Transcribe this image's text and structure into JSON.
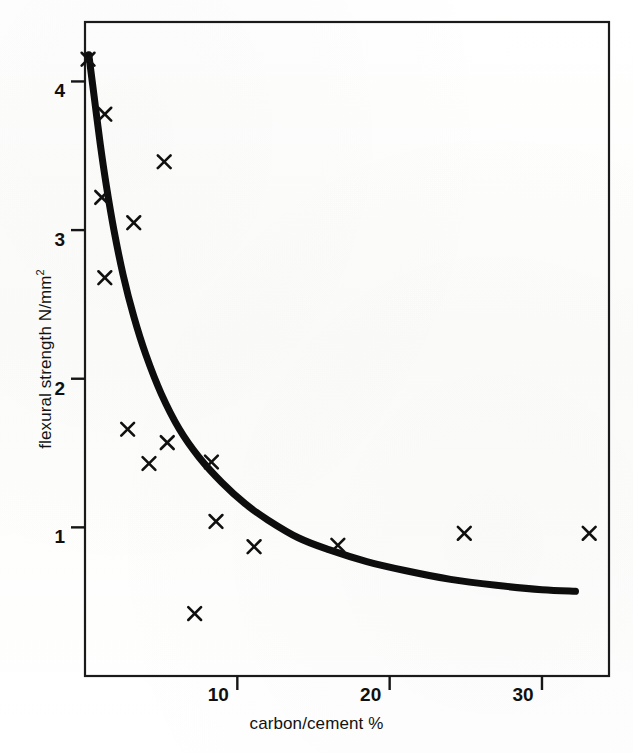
{
  "figure": {
    "background_color": "#fdfdfb",
    "ink_color": "#101010"
  },
  "chart_data": {
    "type": "scatter",
    "title": "",
    "subtitle": "",
    "xlabel": "carbon/cement %",
    "ylabel": "flexural strength N/mm²",
    "ylabel_plain": "flexural strength N/mm2",
    "xlim": [
      0,
      34.4
    ],
    "ylim": [
      0,
      4.4
    ],
    "xticks": [
      10,
      20,
      30
    ],
    "xtick_labels": [
      "10",
      "20",
      "30"
    ],
    "yticks": [
      1,
      2,
      3,
      4
    ],
    "ytick_labels": [
      "1",
      "2",
      "3",
      "4"
    ],
    "grid": false,
    "legend": null,
    "legend_position": "none",
    "frame": "box",
    "marker": "x",
    "marker_color": "#101010",
    "points": [
      {
        "x": 0.2,
        "y": 4.15
      },
      {
        "x": 1.3,
        "y": 3.78
      },
      {
        "x": 5.2,
        "y": 3.46
      },
      {
        "x": 1.1,
        "y": 3.22
      },
      {
        "x": 3.2,
        "y": 3.05
      },
      {
        "x": 1.3,
        "y": 2.68
      },
      {
        "x": 2.8,
        "y": 1.66
      },
      {
        "x": 5.4,
        "y": 1.57
      },
      {
        "x": 4.2,
        "y": 1.43
      },
      {
        "x": 8.3,
        "y": 1.44
      },
      {
        "x": 8.6,
        "y": 1.04
      },
      {
        "x": 11.1,
        "y": 0.87
      },
      {
        "x": 16.6,
        "y": 0.88
      },
      {
        "x": 24.9,
        "y": 0.96
      },
      {
        "x": 33.1,
        "y": 0.96
      },
      {
        "x": 7.2,
        "y": 0.42
      }
    ],
    "fit_curve": {
      "name": "fitted decay curve",
      "color": "#0d0d0d",
      "line_width_px": 7,
      "x": [
        0.25,
        0.6,
        1.0,
        1.4,
        1.9,
        2.5,
        3.2,
        4.0,
        5.0,
        6.2,
        7.5,
        9.0,
        10.5,
        12.0,
        14.0,
        16.0,
        18.5,
        21.0,
        24.0,
        27.0,
        30.0,
        32.2
      ],
      "y": [
        4.18,
        3.9,
        3.58,
        3.3,
        3.0,
        2.7,
        2.42,
        2.16,
        1.9,
        1.66,
        1.47,
        1.3,
        1.16,
        1.05,
        0.93,
        0.85,
        0.77,
        0.71,
        0.65,
        0.61,
        0.58,
        0.57
      ]
    }
  }
}
